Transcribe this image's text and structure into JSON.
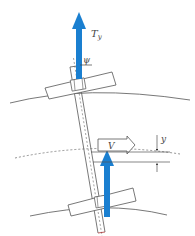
{
  "diagram": {
    "type": "wheelset-lateral-dynamics",
    "labels": {
      "force": "T",
      "force_sub": "y",
      "yaw_angle": "ψ",
      "velocity": "V",
      "lateral_displacement": "y"
    },
    "colors": {
      "force_arrow": "#1a7fd0",
      "line": "#555555",
      "dashed": "#777777",
      "background": "#ffffff"
    }
  }
}
